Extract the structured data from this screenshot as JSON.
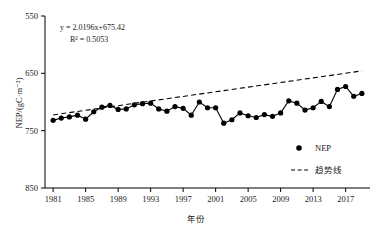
{
  "chart_data": {
    "type": "line",
    "title": "",
    "xlabel": "年份",
    "ylabel": "NEP/(gC·m⁻²)",
    "xlim": [
      1980,
      2020
    ],
    "ylim": [
      550,
      850
    ],
    "grid": false,
    "legend_position": "lower-right",
    "x_ticks": [
      1981,
      1985,
      1989,
      1993,
      1997,
      2001,
      2005,
      2009,
      2013,
      2017
    ],
    "y_ticks": [
      550,
      650,
      750,
      850
    ],
    "annotations": [
      "y = 2.0196x+675.42",
      "R² = 0.5053"
    ],
    "trend": {
      "slope": 2.0196,
      "intercept": 675.42,
      "r_squared": 0.5053,
      "equation": "y = 2.0196x+675.42",
      "r2_text": "R² = 0.5053",
      "style": "dashed",
      "label": "趋势线"
    },
    "series": [
      {
        "name": "NEP",
        "marker": "filled-circle",
        "x": [
          1981,
          1982,
          1983,
          1984,
          1985,
          1986,
          1987,
          1988,
          1989,
          1990,
          1991,
          1992,
          1993,
          1994,
          1995,
          1996,
          1997,
          1998,
          1999,
          2000,
          2001,
          2002,
          2003,
          2004,
          2005,
          2006,
          2007,
          2008,
          2009,
          2010,
          2011,
          2012,
          2013,
          2014,
          2015,
          2016,
          2017,
          2018,
          2019
        ],
        "values": [
          668,
          672,
          674,
          677,
          670,
          683,
          691,
          694,
          687,
          688,
          695,
          697,
          698,
          688,
          684,
          692,
          689,
          677,
          700,
          690,
          690,
          663,
          669,
          681,
          676,
          673,
          678,
          675,
          681,
          702,
          698,
          686,
          690,
          701,
          692,
          722,
          727,
          710,
          715
        ]
      }
    ]
  },
  "legend": {
    "items": [
      {
        "label": "NEP",
        "marker": "filled-circle"
      },
      {
        "label": "趋势线",
        "marker": "dashed-line"
      }
    ]
  },
  "axes": {
    "y_tick_labels": [
      "850",
      "750",
      "650",
      "550"
    ],
    "x_tick_labels": [
      "1981",
      "1985",
      "1989",
      "1993",
      "1997",
      "2001",
      "2005",
      "2009",
      "2013",
      "2017"
    ],
    "y_axis_title": "NEP/(gC·m⁻²)",
    "x_axis_title": "年份"
  },
  "colors": {
    "series": "#000000",
    "trend": "#000000",
    "axis": "#000000",
    "background": "#ffffff"
  }
}
